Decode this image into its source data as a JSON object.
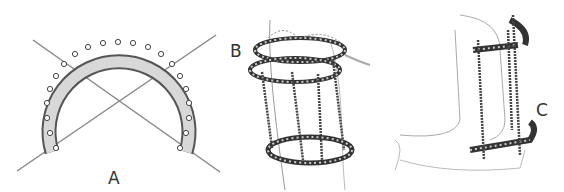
{
  "figure": {
    "panels": [
      {
        "label": "A",
        "subject": "half-ring-with-crossed-wires"
      },
      {
        "label": "B",
        "subject": "circular-frame-on-limb"
      },
      {
        "label": "C",
        "subject": "frame-on-elbow"
      }
    ]
  }
}
